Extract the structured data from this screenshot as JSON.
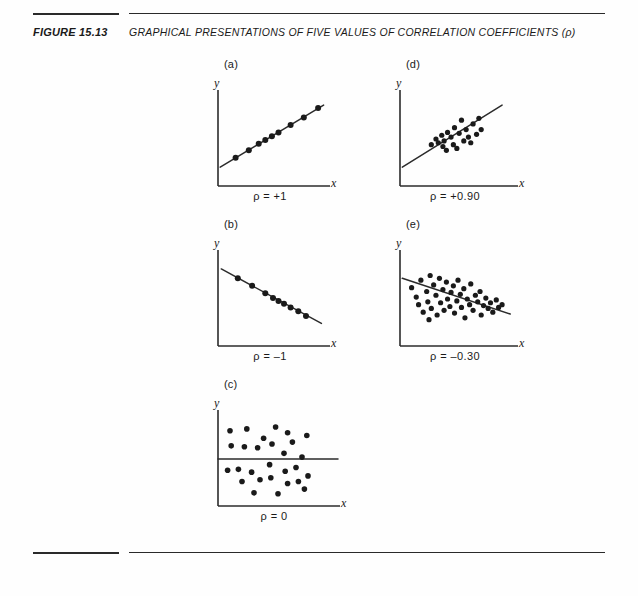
{
  "figure": {
    "number": "FIGURE 15.13",
    "title": "GRAPHICAL PRESENTATIONS OF FIVE VALUES OF CORRELATION COEFFICIENTS (ρ)"
  },
  "axis_labels": {
    "x": "x",
    "y": "y"
  },
  "panels": [
    {
      "id": "a",
      "label": "(a)",
      "rho_label": "ρ = +1",
      "rho_value": 1.0
    },
    {
      "id": "d",
      "label": "(d)",
      "rho_label": "ρ = +0.90",
      "rho_value": 0.9
    },
    {
      "id": "b",
      "label": "(b)",
      "rho_label": "ρ = –1",
      "rho_value": -1.0
    },
    {
      "id": "e",
      "label": "(e)",
      "rho_label": "ρ = –0.30",
      "rho_value": -0.3
    },
    {
      "id": "c",
      "label": "(c)",
      "rho_label": "ρ = 0",
      "rho_value": 0.0
    }
  ],
  "chart_data": [
    {
      "type": "scatter",
      "panel": "a",
      "title": "(a)",
      "annotation": "ρ = +1",
      "xlabel": "x",
      "ylabel": "y",
      "xlim": [
        0,
        100
      ],
      "ylim": [
        0,
        100
      ],
      "grid": false,
      "legend": "none",
      "trend_line": {
        "x0": 2,
        "y0": 20,
        "x1": 96,
        "y1": 86
      },
      "points": [
        {
          "x": 16,
          "y": 30
        },
        {
          "x": 28,
          "y": 38
        },
        {
          "x": 37,
          "y": 45
        },
        {
          "x": 43,
          "y": 49
        },
        {
          "x": 49,
          "y": 53
        },
        {
          "x": 55,
          "y": 57
        },
        {
          "x": 66,
          "y": 65
        },
        {
          "x": 78,
          "y": 73
        },
        {
          "x": 91,
          "y": 83
        }
      ]
    },
    {
      "type": "scatter",
      "panel": "d",
      "title": "(d)",
      "annotation": "ρ = +0.90",
      "xlabel": "x",
      "ylabel": "y",
      "xlim": [
        0,
        100
      ],
      "ylim": [
        0,
        100
      ],
      "grid": false,
      "legend": "none",
      "trend_line": {
        "x0": 2,
        "y0": 20,
        "x1": 88,
        "y1": 86
      },
      "points": [
        {
          "x": 27,
          "y": 44
        },
        {
          "x": 31,
          "y": 50
        },
        {
          "x": 33,
          "y": 46
        },
        {
          "x": 36,
          "y": 54
        },
        {
          "x": 37,
          "y": 42
        },
        {
          "x": 38,
          "y": 48
        },
        {
          "x": 40,
          "y": 38
        },
        {
          "x": 41,
          "y": 57
        },
        {
          "x": 44,
          "y": 52
        },
        {
          "x": 46,
          "y": 44
        },
        {
          "x": 47,
          "y": 62
        },
        {
          "x": 49,
          "y": 40
        },
        {
          "x": 51,
          "y": 56
        },
        {
          "x": 53,
          "y": 70
        },
        {
          "x": 55,
          "y": 48
        },
        {
          "x": 57,
          "y": 60
        },
        {
          "x": 59,
          "y": 52
        },
        {
          "x": 61,
          "y": 46
        },
        {
          "x": 63,
          "y": 66
        },
        {
          "x": 66,
          "y": 55
        },
        {
          "x": 68,
          "y": 72
        },
        {
          "x": 70,
          "y": 60
        }
      ]
    },
    {
      "type": "scatter",
      "panel": "b",
      "title": "(b)",
      "annotation": "ρ = –1",
      "xlabel": "x",
      "ylabel": "y",
      "xlim": [
        0,
        100
      ],
      "ylim": [
        0,
        100
      ],
      "grid": false,
      "legend": "none",
      "trend_line": {
        "x0": 3,
        "y0": 82,
        "x1": 94,
        "y1": 24
      },
      "points": [
        {
          "x": 18,
          "y": 72
        },
        {
          "x": 31,
          "y": 64
        },
        {
          "x": 43,
          "y": 56
        },
        {
          "x": 50,
          "y": 51
        },
        {
          "x": 55,
          "y": 48
        },
        {
          "x": 60,
          "y": 45
        },
        {
          "x": 66,
          "y": 41
        },
        {
          "x": 73,
          "y": 37
        },
        {
          "x": 80,
          "y": 32
        }
      ]
    },
    {
      "type": "scatter",
      "panel": "e",
      "title": "(e)",
      "annotation": "ρ = –0.30",
      "xlabel": "x",
      "ylabel": "y",
      "xlim": [
        0,
        100
      ],
      "ylim": [
        0,
        100
      ],
      "grid": false,
      "legend": "none",
      "trend_line": {
        "x0": 2,
        "y0": 72,
        "x1": 95,
        "y1": 34
      },
      "points": [
        {
          "x": 10,
          "y": 62
        },
        {
          "x": 14,
          "y": 52
        },
        {
          "x": 16,
          "y": 44
        },
        {
          "x": 18,
          "y": 70
        },
        {
          "x": 20,
          "y": 36
        },
        {
          "x": 23,
          "y": 58
        },
        {
          "x": 24,
          "y": 47
        },
        {
          "x": 26,
          "y": 75
        },
        {
          "x": 27,
          "y": 40
        },
        {
          "x": 29,
          "y": 65
        },
        {
          "x": 31,
          "y": 54
        },
        {
          "x": 32,
          "y": 33
        },
        {
          "x": 34,
          "y": 72
        },
        {
          "x": 35,
          "y": 46
        },
        {
          "x": 37,
          "y": 60
        },
        {
          "x": 38,
          "y": 38
        },
        {
          "x": 40,
          "y": 68
        },
        {
          "x": 41,
          "y": 50
        },
        {
          "x": 43,
          "y": 42
        },
        {
          "x": 44,
          "y": 57
        },
        {
          "x": 46,
          "y": 64
        },
        {
          "x": 47,
          "y": 35
        },
        {
          "x": 49,
          "y": 48
        },
        {
          "x": 50,
          "y": 70
        },
        {
          "x": 52,
          "y": 55
        },
        {
          "x": 53,
          "y": 41
        },
        {
          "x": 55,
          "y": 61
        },
        {
          "x": 56,
          "y": 30
        },
        {
          "x": 58,
          "y": 50
        },
        {
          "x": 60,
          "y": 44
        },
        {
          "x": 61,
          "y": 66
        },
        {
          "x": 63,
          "y": 38
        },
        {
          "x": 65,
          "y": 54
        },
        {
          "x": 67,
          "y": 47
        },
        {
          "x": 69,
          "y": 58
        },
        {
          "x": 70,
          "y": 33
        },
        {
          "x": 72,
          "y": 43
        },
        {
          "x": 74,
          "y": 51
        },
        {
          "x": 76,
          "y": 40
        },
        {
          "x": 78,
          "y": 46
        },
        {
          "x": 80,
          "y": 36
        },
        {
          "x": 83,
          "y": 49
        },
        {
          "x": 85,
          "y": 41
        },
        {
          "x": 88,
          "y": 44
        },
        {
          "x": 25,
          "y": 28
        }
      ]
    },
    {
      "type": "scatter",
      "panel": "c",
      "title": "(c)",
      "annotation": "ρ = 0",
      "xlabel": "x",
      "ylabel": "y",
      "xlim": [
        0,
        100
      ],
      "ylim": [
        0,
        100
      ],
      "grid": false,
      "legend": "none",
      "trend_line": {
        "x0": 0,
        "y0": 50,
        "x1": 100,
        "y1": 50
      },
      "points": [
        {
          "x": 10,
          "y": 80
        },
        {
          "x": 11,
          "y": 64
        },
        {
          "x": 24,
          "y": 82
        },
        {
          "x": 22,
          "y": 63
        },
        {
          "x": 33,
          "y": 62
        },
        {
          "x": 38,
          "y": 72
        },
        {
          "x": 45,
          "y": 66
        },
        {
          "x": 48,
          "y": 84
        },
        {
          "x": 55,
          "y": 56
        },
        {
          "x": 58,
          "y": 78
        },
        {
          "x": 62,
          "y": 68
        },
        {
          "x": 70,
          "y": 52
        },
        {
          "x": 74,
          "y": 75
        },
        {
          "x": 8,
          "y": 38
        },
        {
          "x": 17,
          "y": 39
        },
        {
          "x": 20,
          "y": 26
        },
        {
          "x": 28,
          "y": 36
        },
        {
          "x": 30,
          "y": 14
        },
        {
          "x": 35,
          "y": 28
        },
        {
          "x": 43,
          "y": 44
        },
        {
          "x": 44,
          "y": 30
        },
        {
          "x": 50,
          "y": 13
        },
        {
          "x": 56,
          "y": 37
        },
        {
          "x": 58,
          "y": 24
        },
        {
          "x": 65,
          "y": 41
        },
        {
          "x": 67,
          "y": 26
        },
        {
          "x": 72,
          "y": 18
        },
        {
          "x": 75,
          "y": 32
        }
      ]
    }
  ]
}
